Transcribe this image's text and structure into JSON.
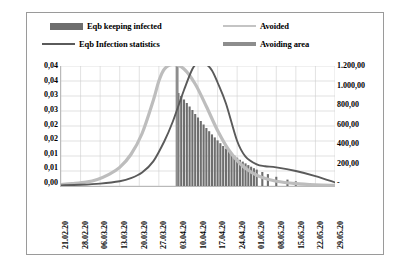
{
  "legend": {
    "items": [
      {
        "id": "bars",
        "label": "Eqb keeping infected",
        "marker": "filled-bar-swatch",
        "color": "#6e6e6e"
      },
      {
        "id": "infection",
        "label": "Eqb Infection statistics",
        "marker": "line-swatch",
        "color": "#5a5a5a"
      },
      {
        "id": "avoided",
        "label": "Avoided",
        "marker": "line-swatch",
        "color": "#bdbdbd"
      },
      {
        "id": "area",
        "label": "Avoiding area",
        "marker": "thick-line-swatch",
        "color": "#8d8d8d"
      }
    ]
  },
  "axes": {
    "y_left_labels": [
      "0,04",
      "0,04",
      "0,03",
      "0,03",
      "0,02",
      "0,02",
      "0,01",
      "0,01",
      "0,00"
    ],
    "y_right_labels": [
      "1.200,00",
      "1.000,00",
      "800,00",
      "600,00",
      "400,00",
      "200,00",
      "-"
    ],
    "x_labels": [
      "21.02.20",
      "28.02.20",
      "06.03.20",
      "13.03.20",
      "20.03.20",
      "27.03.20",
      "03.04.20",
      "10.04.20",
      "17.04.20",
      "24.04.20",
      "01.05.20",
      "08.05.20",
      "15.05.20",
      "22.05.20",
      "29.05.20"
    ]
  },
  "chart_data": {
    "type": "line",
    "title": "",
    "xlabel": "",
    "ylabel": "",
    "grid": true,
    "legend_position": "top",
    "x_tick_labels": [
      "21.02.20",
      "28.02.20",
      "06.03.20",
      "13.03.20",
      "20.03.20",
      "27.03.20",
      "03.04.20",
      "10.04.20",
      "17.04.20",
      "24.04.20",
      "01.05.20",
      "08.05.20",
      "15.05.20",
      "22.05.20",
      "29.05.20"
    ],
    "y_left_axis": {
      "label": "",
      "ylim": [
        0,
        0.04
      ],
      "ticks": [
        0,
        0.005,
        0.01,
        0.015,
        0.02,
        0.025,
        0.03,
        0.035,
        0.04
      ],
      "tick_labels": [
        "0,00",
        "0,01",
        "0,01",
        "0,02",
        "0,02",
        "0,03",
        "0,03",
        "0,04",
        "0,04"
      ]
    },
    "y_right_axis": {
      "label": "",
      "ylim": [
        0,
        1200
      ],
      "ticks": [
        0,
        200,
        400,
        600,
        800,
        1000,
        1200
      ],
      "tick_labels": [
        "-",
        "200,00",
        "400,00",
        "600,00",
        "800,00",
        "1.000,00",
        "1.200,00"
      ]
    },
    "series": [
      {
        "name": "Avoided",
        "type": "line",
        "axis": "left",
        "color": "#bdbdbd",
        "x": [
          "21.02.20",
          "25.02.20",
          "01.03.20",
          "05.03.20",
          "09.03.20",
          "13.03.20",
          "17.03.20",
          "21.03.20",
          "25.03.20",
          "27.03.20",
          "29.03.20",
          "01.04.20",
          "05.04.20",
          "09.04.20",
          "13.04.20",
          "17.04.20",
          "21.04.20",
          "25.04.20",
          "29.04.20",
          "03.05.20",
          "08.05.20",
          "15.05.20",
          "22.05.20",
          "29.05.20"
        ],
        "values": [
          0.0005,
          0.0008,
          0.0013,
          0.0022,
          0.0038,
          0.0062,
          0.0105,
          0.0175,
          0.0285,
          0.035,
          0.039,
          0.0405,
          0.039,
          0.034,
          0.0265,
          0.0185,
          0.012,
          0.0075,
          0.0046,
          0.0028,
          0.0016,
          0.0008,
          0.0004,
          0.0002
        ]
      },
      {
        "name": "Eqb Infection statistics",
        "type": "line",
        "axis": "left",
        "color": "#5a5a5a",
        "x": [
          "21.02.20",
          "28.02.20",
          "06.03.20",
          "13.03.20",
          "17.03.20",
          "21.03.20",
          "25.03.20",
          "29.03.20",
          "01.04.20",
          "05.04.20",
          "08.04.20",
          "10.04.20",
          "13.04.20",
          "15.04.20",
          "17.04.20",
          "20.04.20",
          "24.04.20",
          "27.04.20",
          "01.05.20",
          "04.05.20",
          "08.05.20",
          "15.05.20",
          "22.05.20",
          "29.05.20"
        ],
        "values": [
          0.0002,
          0.0004,
          0.0008,
          0.0016,
          0.0026,
          0.0045,
          0.0082,
          0.015,
          0.0215,
          0.032,
          0.039,
          0.041,
          0.0405,
          0.0385,
          0.0345,
          0.0275,
          0.015,
          0.0098,
          0.0072,
          0.0066,
          0.0062,
          0.005,
          0.0033,
          0.0012
        ]
      },
      {
        "name": "Eqb keeping infected",
        "type": "bar",
        "axis": "right",
        "color": "#6e6e6e",
        "x": [
          "03.04.20",
          "04.04.20",
          "05.04.20",
          "06.04.20",
          "07.04.20",
          "08.04.20",
          "09.04.20",
          "10.04.20",
          "11.04.20",
          "12.04.20",
          "13.04.20",
          "14.04.20",
          "15.04.20",
          "16.04.20",
          "17.04.20",
          "18.04.20",
          "19.04.20",
          "20.04.20",
          "21.04.20",
          "22.04.20",
          "23.04.20",
          "24.04.20",
          "25.04.20",
          "26.04.20",
          "27.04.20",
          "28.04.20",
          "29.04.20",
          "30.04.20",
          "01.05.20",
          "03.05.20",
          "05.05.20",
          "08.05.20",
          "12.05.20",
          "15.05.20",
          "20.05.20",
          "25.05.20",
          "29.05.20"
        ],
        "values": [
          930,
          900,
          865,
          830,
          795,
          760,
          720,
          685,
          650,
          615,
          580,
          548,
          516,
          486,
          456,
          428,
          400,
          374,
          350,
          326,
          304,
          283,
          262,
          244,
          226,
          209,
          193,
          178,
          164,
          140,
          119,
          92,
          64,
          47,
          28,
          16,
          9
        ]
      },
      {
        "name": "Avoiding area",
        "type": "vertical-band",
        "axis": "left",
        "color": "#8d8d8d",
        "x_start": "02.04.20",
        "x_end": "03.04.20",
        "value_top": 0.0415
      }
    ]
  }
}
